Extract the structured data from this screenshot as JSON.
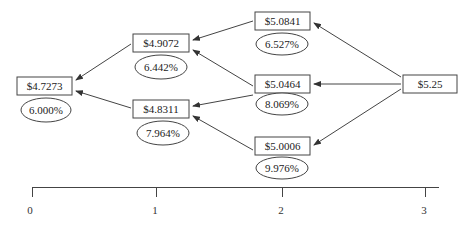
{
  "diagram": {
    "colors": {
      "stroke": "#444444",
      "text": "#222222",
      "background": "#ffffff"
    },
    "nodes": [
      {
        "id": "n0",
        "price": "$4.7273",
        "rate": "6.000%",
        "period": 0
      },
      {
        "id": "n1u",
        "price": "$4.9072",
        "rate": "6.442%",
        "period": 1
      },
      {
        "id": "n1d",
        "price": "$4.8311",
        "rate": "7.964%",
        "period": 1
      },
      {
        "id": "n2uu",
        "price": "$5.0841",
        "rate": "6.527%",
        "period": 2
      },
      {
        "id": "n2ud",
        "price": "$5.0464",
        "rate": "8.069%",
        "period": 2
      },
      {
        "id": "n2dd",
        "price": "$5.0006",
        "rate": "9.976%",
        "period": 2
      },
      {
        "id": "n3",
        "price": "$5.25",
        "rate": "",
        "period": 3
      }
    ],
    "edges": [
      {
        "from": "n1u",
        "to": "n0"
      },
      {
        "from": "n1d",
        "to": "n0"
      },
      {
        "from": "n2uu",
        "to": "n1u"
      },
      {
        "from": "n2ud",
        "to": "n1u"
      },
      {
        "from": "n2ud",
        "to": "n1d"
      },
      {
        "from": "n2dd",
        "to": "n1d"
      },
      {
        "from": "n3",
        "to": "n2uu"
      },
      {
        "from": "n3",
        "to": "n2ud"
      },
      {
        "from": "n3",
        "to": "n2dd"
      }
    ],
    "axis": {
      "ticks": [
        "0",
        "1",
        "2",
        "3"
      ]
    }
  }
}
